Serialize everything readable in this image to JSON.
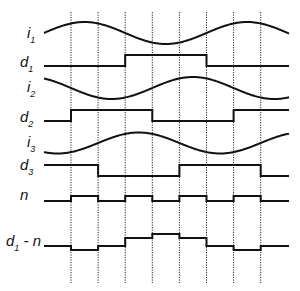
{
  "colors": {
    "line": "#111111",
    "grid": "#222222",
    "background": "#ffffff"
  },
  "chart_data": {
    "type": "line",
    "x_range": [
      0,
      6.6
    ],
    "x_units": "sector (one sector = 60 degrees)",
    "sector_boundaries": [
      1,
      2,
      3,
      4,
      5,
      6,
      7,
      8
    ],
    "grid": "vertical dotted lines at sector boundaries",
    "traces": [
      {
        "id": "i1",
        "label": "i",
        "sub": "1",
        "kind": "sine",
        "amplitude": 1,
        "phase_peak_sector": 1.5,
        "period_sectors": 6
      },
      {
        "id": "d1",
        "label": "d",
        "sub": "1",
        "kind": "step",
        "levels": [
          0,
          1,
          0
        ],
        "transitions": [
          3,
          6
        ]
      },
      {
        "id": "i2",
        "label": "i",
        "sub": "2",
        "kind": "sine",
        "amplitude": 1,
        "phase_peak_sector": 5.5,
        "period_sectors": 6
      },
      {
        "id": "d2",
        "label": "d",
        "sub": "2",
        "kind": "step",
        "levels": [
          0,
          1,
          0,
          1
        ],
        "transitions": [
          1,
          4,
          7
        ]
      },
      {
        "id": "i3",
        "label": "i",
        "sub": "3",
        "kind": "sine",
        "amplitude": 1,
        "phase_peak_sector": 3.5,
        "period_sectors": 6
      },
      {
        "id": "d3",
        "label": "d",
        "sub": "3",
        "kind": "step",
        "levels": [
          1,
          0,
          1,
          0
        ],
        "transitions": [
          2,
          5,
          8
        ]
      },
      {
        "id": "n",
        "label": "n",
        "sub": "",
        "kind": "step",
        "levels": [
          0,
          1,
          0,
          1,
          0,
          1,
          0,
          1,
          0
        ],
        "transitions": [
          1,
          2,
          3,
          4,
          5,
          6,
          7,
          8
        ]
      },
      {
        "id": "d1n",
        "label": "d",
        "sub": "1",
        "suffix": " - n",
        "kind": "step",
        "levels": [
          0,
          -1,
          0,
          2,
          3,
          2,
          0,
          -1,
          0
        ],
        "transitions": [
          1,
          2,
          3,
          4,
          5,
          6,
          7,
          8
        ]
      }
    ]
  }
}
